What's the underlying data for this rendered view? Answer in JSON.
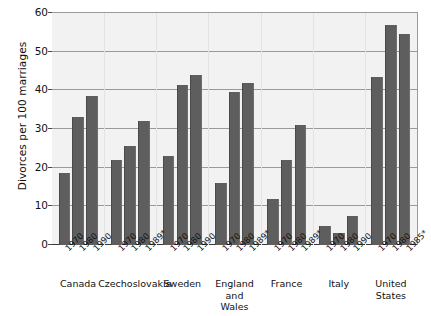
{
  "chart_data": {
    "type": "bar",
    "title": "",
    "subtitle": "",
    "xlabel": "",
    "ylabel": "Divorces per 100 marriages",
    "ylim": [
      0,
      60
    ],
    "yticks": [
      0,
      10,
      20,
      30,
      40,
      50,
      60
    ],
    "grid": true,
    "legend": "none",
    "categories": [
      "Canada",
      "Czechoslovakia",
      "Sweden",
      "England and Wales",
      "France",
      "Italy",
      "United States"
    ],
    "groups": [
      {
        "name": "Canada",
        "label_lines": [
          "Canada"
        ],
        "bars": [
          {
            "year": "1970",
            "value": 18.5
          },
          {
            "year": "1980",
            "value": 33.0
          },
          {
            "year": "1990",
            "value": 38.5
          }
        ]
      },
      {
        "name": "Czechoslovakia",
        "label_lines": [
          "Czechoslovakia"
        ],
        "bars": [
          {
            "year": "1970",
            "value": 22.0
          },
          {
            "year": "1980",
            "value": 25.5
          },
          {
            "year": "1989*",
            "value": 32.0
          }
        ]
      },
      {
        "name": "Sweden",
        "label_lines": [
          "Sweden"
        ],
        "bars": [
          {
            "year": "1970",
            "value": 23.0
          },
          {
            "year": "1980",
            "value": 41.5
          },
          {
            "year": "1990",
            "value": 44.0
          }
        ]
      },
      {
        "name": "England and Wales",
        "label_lines": [
          "England",
          "and",
          "Wales"
        ],
        "bars": [
          {
            "year": "1970",
            "value": 16.0
          },
          {
            "year": "1980",
            "value": 39.5
          },
          {
            "year": "1989*",
            "value": 42.0
          }
        ]
      },
      {
        "name": "France",
        "label_lines": [
          "France"
        ],
        "bars": [
          {
            "year": "1970",
            "value": 12.0
          },
          {
            "year": "1980",
            "value": 22.0
          },
          {
            "year": "1989*",
            "value": 31.0
          }
        ]
      },
      {
        "name": "Italy",
        "label_lines": [
          "Italy"
        ],
        "bars": [
          {
            "year": "1970",
            "value": 5.0
          },
          {
            "year": "1980",
            "value": 3.0
          },
          {
            "year": "1990",
            "value": 7.5
          }
        ]
      },
      {
        "name": "United States",
        "label_lines": [
          "United States"
        ],
        "bars": [
          {
            "year": "1970",
            "value": 43.5
          },
          {
            "year": "1980",
            "value": 57.0
          },
          {
            "year": "1985*",
            "value": 54.5
          }
        ]
      }
    ],
    "colors": {
      "bar": "#5e5e5e",
      "plot_background": "#f2f2f2",
      "gridline": "#9a9a9a",
      "axis": "#3a3a3a",
      "text": "#111111",
      "page_background": "#ffffff"
    }
  }
}
